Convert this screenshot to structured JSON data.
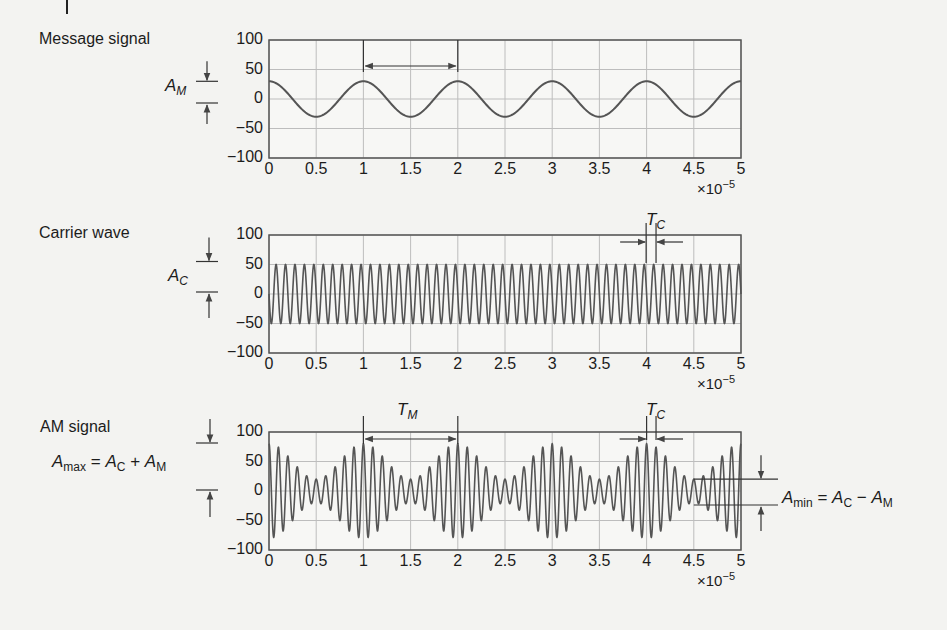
{
  "colors": {
    "background": "#f3f3f1",
    "grid": "#bdbdbd",
    "frame": "#555555",
    "trace": "#555555",
    "annotation": "#333333"
  },
  "x_axis": {
    "ticks": [
      "0",
      "0.5",
      "1",
      "1.5",
      "2",
      "2.5",
      "3",
      "3.5",
      "4",
      "4.5",
      "5"
    ],
    "scale_base": "×10",
    "scale_exp": "−5"
  },
  "y_axis": {
    "ticks": [
      "100",
      "50",
      "0",
      "−50",
      "−100"
    ]
  },
  "panels": [
    {
      "title": "Message signal",
      "amp_label": {
        "main": "A",
        "sub": "M"
      },
      "period_label": {
        "main": "T",
        "sub": "M"
      }
    },
    {
      "title": "Carrier wave",
      "amp_label": {
        "main": "A",
        "sub": "C"
      },
      "period_label": {
        "main": "T",
        "sub": "C"
      }
    },
    {
      "title": "AM signal",
      "amax_eq": {
        "lhs": "A",
        "lhs_sub": "max",
        "eq": " = ",
        "a": "A",
        "a_sub": "C",
        "op": " + ",
        "b": "A",
        "b_sub": "M"
      },
      "amin_eq": {
        "lhs": "A",
        "lhs_sub": "min",
        "eq": " = ",
        "a": "A",
        "a_sub": "C",
        "op": " − ",
        "b": "A",
        "b_sub": "M"
      },
      "period_label_m": {
        "main": "T",
        "sub": "M"
      },
      "period_label_c": {
        "main": "T",
        "sub": "C"
      }
    }
  ],
  "chart_data": [
    {
      "type": "line",
      "title": "Message signal",
      "xlabel": "",
      "ylabel": "",
      "x_multiplier": "1e-5",
      "xlim": [
        0,
        5
      ],
      "ylim": [
        -100,
        100
      ],
      "grid": true,
      "series": [
        {
          "name": "message",
          "function": "30*cos(2*pi*t/1)",
          "amplitude": 30,
          "period": 1,
          "phase": 0
        }
      ],
      "annotations": [
        "A_M (amplitude, 0 to 30)",
        "T_M (period, from 1 to 2)"
      ]
    },
    {
      "type": "line",
      "title": "Carrier wave",
      "xlabel": "",
      "ylabel": "",
      "x_multiplier": "1e-5",
      "xlim": [
        0,
        5
      ],
      "ylim": [
        -100,
        100
      ],
      "grid": true,
      "series": [
        {
          "name": "carrier",
          "function": "50*cos(2*pi*t/0.1)",
          "amplitude": 50,
          "period": 0.1,
          "cycles_shown": 50
        }
      ],
      "annotations": [
        "A_C (amplitude, 0 to 50)",
        "T_C (period, near t=4 to 4.1)"
      ]
    },
    {
      "type": "line",
      "title": "AM signal",
      "xlabel": "",
      "ylabel": "",
      "x_multiplier": "1e-5",
      "xlim": [
        0,
        5
      ],
      "ylim": [
        -100,
        100
      ],
      "grid": true,
      "series": [
        {
          "name": "am",
          "function": "(50 + 30*cos(2*pi*t/1)) * cos(2*pi*t/0.1)",
          "envelope_max": 80,
          "envelope_min": 20
        }
      ],
      "annotations": [
        "A_max = A_C + A_M",
        "A_min = A_C − A_M",
        "T_M (period, from 1 to 2)",
        "T_C (period, near t=4 to 4.1)"
      ]
    }
  ]
}
